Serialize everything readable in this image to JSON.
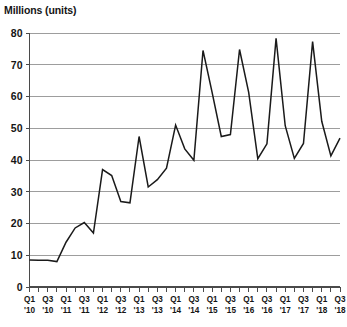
{
  "chart_data": {
    "type": "line",
    "title": "Millions (units)",
    "xlabel": "",
    "ylabel": "Millions (units)",
    "ylim": [
      0,
      80
    ],
    "ytick_values": [
      0,
      10,
      20,
      30,
      40,
      50,
      60,
      70,
      80
    ],
    "ytick_labels": [
      "0",
      "10",
      "20",
      "30",
      "40",
      "50",
      "60",
      "70",
      "80"
    ],
    "grid": true,
    "legend": "none",
    "line_color": "#1a1a1a",
    "grid_color": "#9d9d9d",
    "x": [
      "Q1 '10",
      "Q2 '10",
      "Q3 '10",
      "Q4 '10",
      "Q1 '11",
      "Q2 '11",
      "Q3 '11",
      "Q4 '11",
      "Q1 '12",
      "Q2 '12",
      "Q3 '12",
      "Q4 '12",
      "Q1 '13",
      "Q2 '13",
      "Q3 '13",
      "Q4 '13",
      "Q1 '14",
      "Q2 '14",
      "Q3 '14",
      "Q4 '14",
      "Q1 '15",
      "Q2 '15",
      "Q3 '15",
      "Q4 '15",
      "Q1 '16",
      "Q2 '16",
      "Q3 '16",
      "Q4 '16",
      "Q1 '17",
      "Q2 '17",
      "Q3 '17",
      "Q4 '17",
      "Q1 '18",
      "Q2 '18",
      "Q3 '18"
    ],
    "xtick_labels": [
      {
        "quarter": "Q1",
        "year": "'10",
        "show": true
      },
      {
        "quarter": "Q2",
        "year": "'10",
        "show": false
      },
      {
        "quarter": "Q3",
        "year": "'10",
        "show": true
      },
      {
        "quarter": "Q4",
        "year": "'10",
        "show": false
      },
      {
        "quarter": "Q1",
        "year": "'11",
        "show": true
      },
      {
        "quarter": "Q2",
        "year": "'11",
        "show": false
      },
      {
        "quarter": "Q3",
        "year": "'11",
        "show": true
      },
      {
        "quarter": "Q4",
        "year": "'11",
        "show": false
      },
      {
        "quarter": "Q1",
        "year": "'12",
        "show": true
      },
      {
        "quarter": "Q2",
        "year": "'12",
        "show": false
      },
      {
        "quarter": "Q3",
        "year": "'12",
        "show": true
      },
      {
        "quarter": "Q4",
        "year": "'12",
        "show": false
      },
      {
        "quarter": "Q1",
        "year": "'13",
        "show": true
      },
      {
        "quarter": "Q2",
        "year": "'13",
        "show": false
      },
      {
        "quarter": "Q3",
        "year": "'13",
        "show": true
      },
      {
        "quarter": "Q4",
        "year": "'13",
        "show": false
      },
      {
        "quarter": "Q1",
        "year": "'14",
        "show": true
      },
      {
        "quarter": "Q2",
        "year": "'14",
        "show": false
      },
      {
        "quarter": "Q3",
        "year": "'14",
        "show": true
      },
      {
        "quarter": "Q4",
        "year": "'14",
        "show": false
      },
      {
        "quarter": "Q1",
        "year": "'15",
        "show": true
      },
      {
        "quarter": "Q2",
        "year": "'15",
        "show": false
      },
      {
        "quarter": "Q3",
        "year": "'15",
        "show": true
      },
      {
        "quarter": "Q4",
        "year": "'15",
        "show": false
      },
      {
        "quarter": "Q1",
        "year": "'16",
        "show": true
      },
      {
        "quarter": "Q2",
        "year": "'16",
        "show": false
      },
      {
        "quarter": "Q3",
        "year": "'16",
        "show": true
      },
      {
        "quarter": "Q4",
        "year": "'16",
        "show": false
      },
      {
        "quarter": "Q1",
        "year": "'17",
        "show": true
      },
      {
        "quarter": "Q2",
        "year": "'17",
        "show": false
      },
      {
        "quarter": "Q3",
        "year": "'17",
        "show": true
      },
      {
        "quarter": "Q4",
        "year": "'17",
        "show": false
      },
      {
        "quarter": "Q1",
        "year": "'18",
        "show": true
      },
      {
        "quarter": "Q2",
        "year": "'18",
        "show": false
      },
      {
        "quarter": "Q3",
        "year": "'18",
        "show": true
      }
    ],
    "values": [
      8.5,
      8.4,
      8.4,
      8.0,
      14.1,
      18.6,
      20.3,
      17.0,
      37.0,
      35.1,
      26.9,
      26.5,
      47.4,
      31.5,
      33.8,
      37.4,
      51.0,
      43.5,
      39.9,
      74.5,
      61.2,
      47.4,
      48.0,
      74.8,
      61.3,
      40.4,
      45.1,
      78.3,
      50.8,
      40.5,
      45.2,
      77.3,
      52.2,
      41.3,
      46.9
    ]
  }
}
